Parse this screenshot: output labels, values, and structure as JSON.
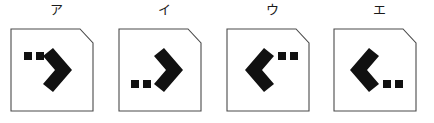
{
  "figure": {
    "background_color": "#ffffff",
    "ink_color": "#111111",
    "outline_color": "#4a4a4a",
    "panel_count": 4
  },
  "options": [
    {
      "id": "option-a",
      "label": "ア",
      "chevron_direction": "right",
      "dots_position": "upper-left",
      "dot_count": 2
    },
    {
      "id": "option-i",
      "label": "イ",
      "chevron_direction": "right",
      "dots_position": "lower-left",
      "dot_count": 2
    },
    {
      "id": "option-u",
      "label": "ウ",
      "chevron_direction": "left",
      "dots_position": "upper-right",
      "dot_count": 2
    },
    {
      "id": "option-e",
      "label": "エ",
      "chevron_direction": "left",
      "dots_position": "lower-right",
      "dot_count": 2
    }
  ],
  "geometry": {
    "panel_size": 84,
    "corner_cut": 13,
    "dot_size": 7,
    "dot_gap": 5
  }
}
